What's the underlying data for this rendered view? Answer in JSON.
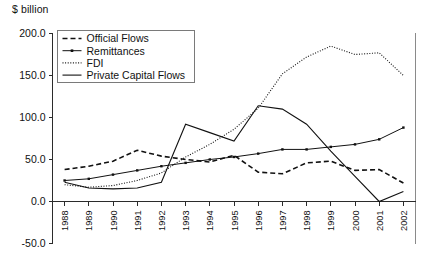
{
  "chart": {
    "unit_label": "$ billion",
    "y_axis": {
      "labels": [
        "200.0",
        "150.0",
        "100.0",
        "50.0",
        "0.0",
        "-50.0"
      ]
    },
    "legend": {
      "items": [
        {
          "label": "Official Flows",
          "style": "dashed"
        },
        {
          "label": "Remittances",
          "style": "line-markers"
        },
        {
          "label": "FDI",
          "style": "dotted"
        },
        {
          "label": "Private Capital Flows",
          "style": "solid"
        }
      ]
    }
  },
  "chart_data": {
    "type": "line",
    "title": "",
    "subtitle": "",
    "xlabel": "",
    "ylabel": "$ billion",
    "ylim": [
      -50,
      200
    ],
    "yticks": [
      -50,
      0,
      50,
      100,
      150,
      200
    ],
    "grid": false,
    "legend_position": "top-left",
    "categories": [
      "1988",
      "1989",
      "1990",
      "1991",
      "1992",
      "1993",
      "1994",
      "1995",
      "1996",
      "1997",
      "1998",
      "1999",
      "2000",
      "2001",
      "2002"
    ],
    "x": [
      1988,
      1989,
      1990,
      1991,
      1992,
      1993,
      1994,
      1995,
      1996,
      1997,
      1998,
      1999,
      2000,
      2001,
      2002
    ],
    "series": [
      {
        "name": "Official Flows",
        "style": "dashed",
        "values": [
          38,
          42,
          48,
          61,
          54,
          50,
          47,
          55,
          35,
          33,
          46,
          48,
          37,
          38,
          22
        ]
      },
      {
        "name": "Remittances",
        "style": "line-markers",
        "values": [
          25,
          27,
          32,
          37,
          42,
          46,
          50,
          53,
          57,
          62,
          62,
          65,
          68,
          74,
          88
        ]
      },
      {
        "name": "FDI",
        "style": "dotted",
        "values": [
          20,
          17,
          19,
          25,
          34,
          53,
          68,
          86,
          111,
          152,
          172,
          185,
          175,
          177,
          150
        ]
      },
      {
        "name": "Private Capital Flows",
        "style": "solid",
        "values": [
          23,
          16,
          15,
          16,
          23,
          92,
          82,
          72,
          114,
          110,
          92,
          60,
          30,
          0,
          12
        ]
      }
    ]
  }
}
